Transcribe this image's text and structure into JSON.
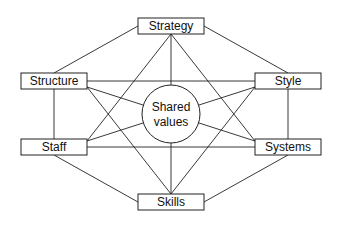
{
  "diagram": {
    "type": "McKinsey 7S framework",
    "center": {
      "id": "shared_values",
      "lines": [
        "Shared",
        "values"
      ]
    },
    "nodes": [
      {
        "id": "strategy",
        "label": "Strategy"
      },
      {
        "id": "structure",
        "label": "Structure"
      },
      {
        "id": "style",
        "label": "Style"
      },
      {
        "id": "staff",
        "label": "Staff"
      },
      {
        "id": "systems",
        "label": "Systems"
      },
      {
        "id": "skills",
        "label": "Skills"
      }
    ],
    "edges": [
      [
        "strategy",
        "structure"
      ],
      [
        "strategy",
        "style"
      ],
      [
        "structure",
        "staff"
      ],
      [
        "style",
        "systems"
      ],
      [
        "staff",
        "skills"
      ],
      [
        "systems",
        "skills"
      ],
      [
        "structure",
        "style"
      ],
      [
        "staff",
        "systems"
      ],
      [
        "strategy",
        "staff"
      ],
      [
        "strategy",
        "systems"
      ],
      [
        "structure",
        "skills"
      ],
      [
        "style",
        "skills"
      ],
      [
        "strategy",
        "shared_values"
      ],
      [
        "skills",
        "shared_values"
      ],
      [
        "structure",
        "shared_values"
      ],
      [
        "style",
        "shared_values"
      ],
      [
        "staff",
        "shared_values"
      ],
      [
        "systems",
        "shared_values"
      ]
    ],
    "colors": {
      "line": "#222222",
      "fill": "#ffffff",
      "text": "#111111"
    }
  }
}
